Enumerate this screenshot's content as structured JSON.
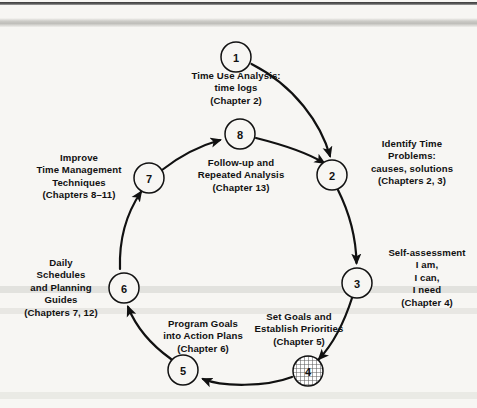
{
  "diagram": {
    "type": "cycle-flowchart",
    "node_count": 8,
    "colors": {
      "background": "#f7f6f3",
      "stroke": "#111111",
      "node_fill": "#f7f6f3",
      "highlight_node_fill": "#b9b9b9"
    },
    "nodes": [
      {
        "number": "1",
        "label": "Time Use Analysis:\ntime logs\n(Chapter 2)",
        "chapter": "Chapter 2",
        "cx": 236,
        "cy": 57,
        "r": 15,
        "shaded": false,
        "label_x": 162,
        "label_y": 70,
        "label_w": 148
      },
      {
        "number": "2",
        "label": "Identify Time\nProblems:\ncauses, solutions\n(Chapters 2, 3)",
        "chapter": "Chapters 2, 3",
        "cx": 332,
        "cy": 175,
        "r": 15,
        "shaded": false,
        "label_x": 352,
        "label_y": 138,
        "label_w": 120
      },
      {
        "number": "3",
        "label": "Self-assessment\nI am,\nI can,\nI need\n(Chapter 4)",
        "chapter": "Chapter 4",
        "cx": 357,
        "cy": 283,
        "r": 15,
        "shaded": false,
        "label_x": 377,
        "label_y": 247,
        "label_w": 100
      },
      {
        "number": "4",
        "label": "Set Goals and\nEstablish Priorities\n(Chapter 5)",
        "chapter": "Chapter 5",
        "cx": 308,
        "cy": 371,
        "r": 15,
        "shaded": true,
        "label_x": 237,
        "label_y": 311,
        "label_w": 124
      },
      {
        "number": "5",
        "label": "Program Goals\ninto Action Plans\n(Chapter 6)",
        "chapter": "Chapter 6",
        "cx": 183,
        "cy": 370,
        "r": 15,
        "shaded": false,
        "label_x": 141,
        "label_y": 318,
        "label_w": 124
      },
      {
        "number": "6",
        "label": "Daily\nSchedules\nand Planning\nGuides\n(Chapters 7, 12)",
        "chapter": "Chapters 7, 12",
        "cx": 124,
        "cy": 288,
        "r": 15,
        "shaded": false,
        "label_x": 12,
        "label_y": 257,
        "label_w": 98
      },
      {
        "number": "7",
        "label": "Improve\nTime Management\nTechniques\n(Chapters 8–11)",
        "chapter": "Chapters 8-11",
        "cx": 149,
        "cy": 178,
        "r": 15,
        "shaded": false,
        "label_x": 20,
        "label_y": 152,
        "label_w": 118
      },
      {
        "number": "8",
        "label": "Follow-up and\nRepeated Analysis\n(Chapter 13)",
        "chapter": "Chapter 13",
        "cx": 240,
        "cy": 134,
        "r": 15,
        "shaded": false,
        "label_x": 180,
        "label_y": 157,
        "label_w": 122
      }
    ],
    "arrows": [
      {
        "from": "1",
        "to": "2",
        "name": "arrow-1-to-2"
      },
      {
        "from": "2",
        "to": "3",
        "name": "arrow-2-to-3"
      },
      {
        "from": "3",
        "to": "4",
        "name": "arrow-3-to-4"
      },
      {
        "from": "4",
        "to": "5",
        "name": "arrow-4-to-5"
      },
      {
        "from": "5",
        "to": "6",
        "name": "arrow-5-to-6"
      },
      {
        "from": "6",
        "to": "7",
        "name": "arrow-6-to-7"
      },
      {
        "from": "7",
        "to": "8",
        "name": "arrow-7-to-8"
      },
      {
        "from": "8",
        "to": "2",
        "name": "arrow-8-to-2"
      }
    ]
  }
}
